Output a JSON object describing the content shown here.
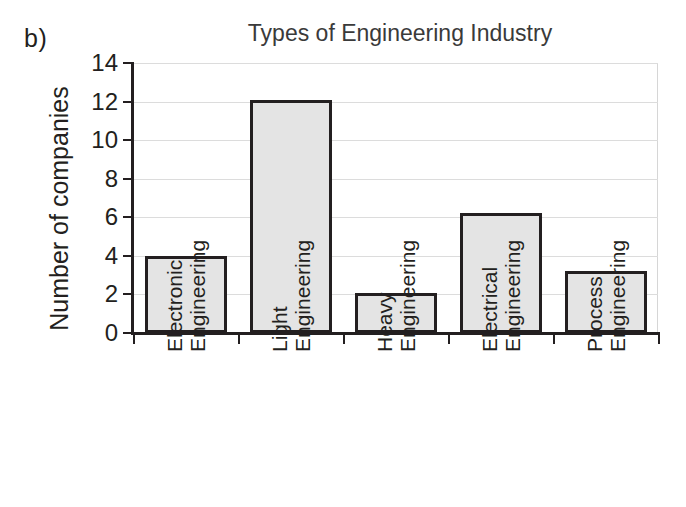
{
  "panel_label": "b)",
  "chart_data": {
    "type": "bar",
    "title": "Types of Engineering Industry",
    "xlabel": "",
    "ylabel": "Number of companies",
    "categories": [
      "Electronic Engineering",
      "Light Engineering",
      "Heavy Engineering",
      "Electrical Engineering",
      "Process Engineering"
    ],
    "category_lines": [
      [
        "Electronic",
        "Engineering"
      ],
      [
        "Light",
        "Engineering"
      ],
      [
        "Heavy",
        "Engineering"
      ],
      [
        "Electrical",
        "Engineering"
      ],
      [
        "Process",
        "Engineering"
      ]
    ],
    "values": [
      4,
      12.1,
      2.1,
      6.2,
      3.2
    ],
    "ylim": [
      0,
      14
    ],
    "yticks": [
      0,
      2,
      4,
      6,
      8,
      10,
      12,
      14
    ],
    "ytick_labels": [
      "0",
      "2",
      "4",
      "6",
      "8",
      "10",
      "12",
      "14"
    ],
    "grid": true,
    "legend": null,
    "bar_fill_color": "#e4e4e4",
    "bar_edge_color": "#231f20",
    "gridline_color": "#dcdcdc",
    "axis_color": "#231f20",
    "title_color": "#3a3a3a"
  }
}
